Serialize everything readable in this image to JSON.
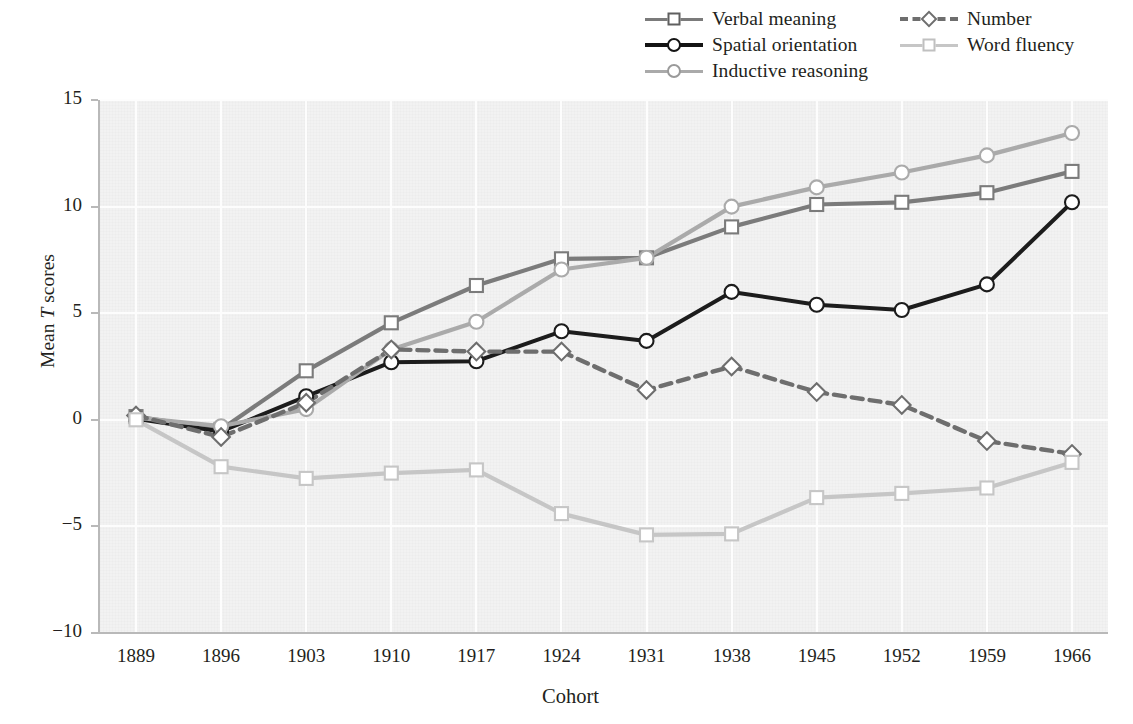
{
  "chart_data": {
    "type": "line",
    "title": "",
    "xlabel": "Cohort",
    "ylabel": "Mean T scores",
    "categories": [
      "1889",
      "1896",
      "1903",
      "1910",
      "1917",
      "1924",
      "1931",
      "1938",
      "1945",
      "1952",
      "1959",
      "1966"
    ],
    "ylim": [
      -10,
      15
    ],
    "yticks": [
      "15",
      "10",
      "5",
      "0",
      "−5",
      "−10"
    ],
    "ytick_values": [
      15,
      10,
      5,
      0,
      -5,
      -10
    ],
    "grid": true,
    "legend_position": "top-right",
    "series": [
      {
        "name": "Verbal meaning",
        "color": "#7b7b7b",
        "marker": "square",
        "dash": "solid",
        "values": [
          0.15,
          -0.45,
          2.3,
          4.55,
          6.3,
          7.55,
          7.6,
          9.05,
          10.1,
          10.2,
          10.65,
          11.65
        ]
      },
      {
        "name": "Spatial orientation",
        "color": "#1c1c1c",
        "marker": "circle",
        "dash": "solid",
        "values": [
          0.05,
          -0.55,
          1.1,
          2.7,
          2.75,
          4.15,
          3.7,
          6.0,
          5.4,
          5.15,
          6.35,
          10.2
        ]
      },
      {
        "name": "Inductive reasoning",
        "color": "#aaaaaa",
        "marker": "circle",
        "dash": "solid",
        "values": [
          0.1,
          -0.3,
          0.5,
          3.3,
          4.6,
          7.05,
          7.6,
          10.0,
          10.9,
          11.6,
          12.4,
          13.45
        ]
      },
      {
        "name": "Number",
        "color": "#6e6e6e",
        "marker": "diamond",
        "dash": "dashed",
        "values": [
          0.2,
          -0.8,
          0.8,
          3.3,
          3.2,
          3.2,
          1.4,
          2.5,
          1.3,
          0.7,
          -1.0,
          -1.6
        ]
      },
      {
        "name": "Word fluency",
        "color": "#c6c6c6",
        "marker": "square",
        "dash": "solid",
        "values": [
          0.0,
          -2.2,
          -2.75,
          -2.5,
          -2.35,
          -4.4,
          -5.4,
          -5.35,
          -3.65,
          -3.45,
          -3.2,
          -2.0
        ]
      }
    ]
  },
  "legend": {
    "columns": [
      [
        {
          "label": "Verbal meaning",
          "icon": "square-marker-icon"
        },
        {
          "label": "Spatial orientation",
          "icon": "circle-marker-icon"
        },
        {
          "label": "Inductive reasoning",
          "icon": "circle-marker-icon"
        }
      ],
      [
        {
          "label": "Number",
          "icon": "diamond-marker-icon"
        },
        {
          "label": "Word fluency",
          "icon": "square-marker-icon"
        }
      ]
    ]
  },
  "axes": {
    "y_title_prefix": "Mean ",
    "y_title_italic": "T",
    "y_title_suffix": " scores",
    "x_title": "Cohort"
  }
}
